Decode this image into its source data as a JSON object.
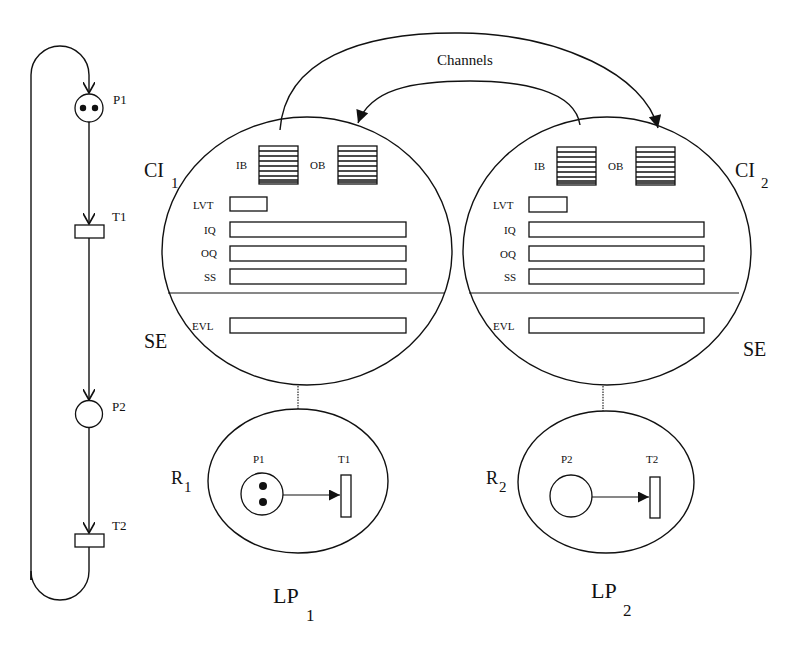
{
  "figure": {
    "top_cropped_text": "",
    "channels_label": "Channels",
    "colors": {
      "ink": "#111111",
      "paper": "#ffffff"
    }
  },
  "petri_net": {
    "places": [
      {
        "id": "P1",
        "label": "P1",
        "tokens": 2
      },
      {
        "id": "P2",
        "label": "P2",
        "tokens": 0
      }
    ],
    "transitions": [
      {
        "id": "T1",
        "label": "T1"
      },
      {
        "id": "T2",
        "label": "T2"
      }
    ],
    "arcs": [
      "P1->T1",
      "T1->P2",
      "P2->T2",
      "T2->P1"
    ]
  },
  "logical_processes": [
    {
      "id": "LP1",
      "name": "LP",
      "name_sub": "1",
      "ci_label": "CI",
      "ci_sub": "1",
      "se_label": "SE",
      "buffers": {
        "input": "IB",
        "output": "OB"
      },
      "rows": {
        "lvt": "LVT",
        "iq": "IQ",
        "oq": "OQ",
        "ss": "SS",
        "evl": "EVL"
      },
      "region": {
        "label": "R",
        "label_sub": "1",
        "place": {
          "label": "P1",
          "tokens": 2
        },
        "transition": {
          "label": "T1"
        }
      }
    },
    {
      "id": "LP2",
      "name": "LP",
      "name_sub": "2",
      "ci_label": "CI",
      "ci_sub": "2",
      "se_label": "SE",
      "buffers": {
        "input": "IB",
        "output": "OB"
      },
      "rows": {
        "lvt": "LVT",
        "iq": "IQ",
        "oq": "OQ",
        "ss": "SS",
        "evl": "EVL"
      },
      "region": {
        "label": "R",
        "label_sub": "2",
        "place": {
          "label": "P2",
          "tokens": 0
        },
        "transition": {
          "label": "T2"
        }
      }
    }
  ]
}
